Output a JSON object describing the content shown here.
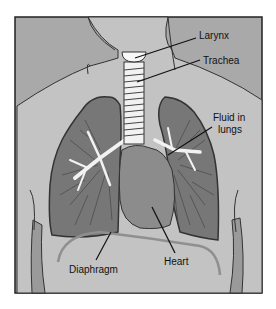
{
  "diagram": {
    "type": "anatomical-illustration",
    "style": "grayscale",
    "labels": {
      "larynx": "Larynx",
      "trachea": "Trachea",
      "fluid_line1": "Fluid in",
      "fluid_line2": "lungs",
      "heart": "Heart",
      "diaphragm": "Diaphragm"
    },
    "colors": {
      "background": "#ffffff",
      "panel": "#b4b4b4",
      "body": "#c4c4c4",
      "shoulders": "#a8a8a8",
      "lung": "#7a7a7a",
      "lung_dark": "#5a5a5a",
      "heart": "#8e8e8e",
      "airway": "#f2f2f2",
      "outline": "#2a2a2a",
      "diaphragm": "#9a9a9a"
    }
  }
}
